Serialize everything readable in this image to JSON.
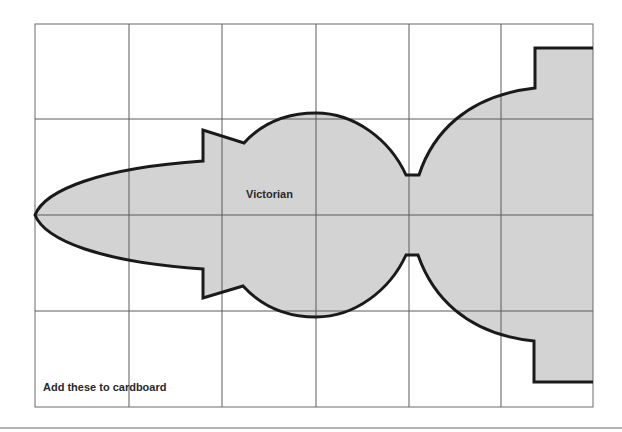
{
  "template": {
    "title": "Victorian",
    "note": "Add these to cardboard"
  },
  "grid": {
    "columns": 6,
    "rows": 4,
    "x_lines": [
      35,
      129,
      222,
      316,
      409,
      501,
      593
    ],
    "y_lines": [
      24,
      119,
      215,
      311,
      407
    ]
  },
  "colors": {
    "background": "#ffffff",
    "fill": "#d3d3d3",
    "outline": "#1a1a1a",
    "grid_line": "#5a5a5a",
    "rule": "#b4b4b4"
  }
}
